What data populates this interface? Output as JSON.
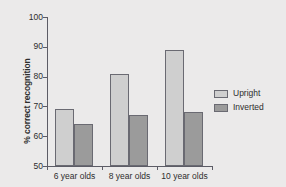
{
  "chart_data": {
    "type": "bar",
    "title": "",
    "xlabel": "",
    "ylabel": "% correct recognition",
    "categories": [
      "6 year olds",
      "8 year olds",
      "10 year olds"
    ],
    "series": [
      {
        "name": "Upright",
        "values": [
          69,
          81,
          89
        ],
        "color": "#cfcfcf"
      },
      {
        "name": "Inverted",
        "values": [
          64,
          67,
          68
        ],
        "color": "#9b9b9b"
      }
    ],
    "ylim": [
      50,
      100
    ],
    "yticks": [
      50,
      60,
      70,
      80,
      90,
      100
    ],
    "ytick_labels": [
      "50",
      "60",
      "70",
      "80",
      "90",
      "100"
    ],
    "grid": false,
    "legend_position": "right",
    "legend_entries": [
      "Upright",
      "Inverted"
    ],
    "background_color": "#ebeaea",
    "axis_color": "#5c5c66",
    "bar_edge_color": "#6a6a72"
  }
}
